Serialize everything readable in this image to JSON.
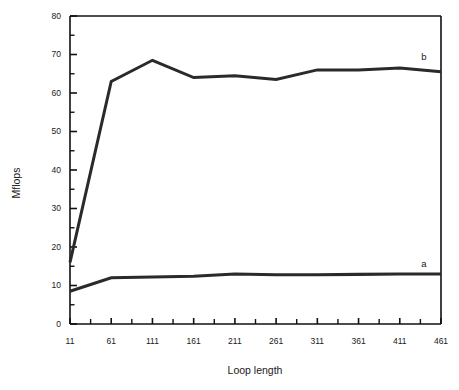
{
  "chart_data": {
    "type": "line",
    "title": "",
    "xlabel": "Loop length",
    "ylabel": "Mflops",
    "xlim": [
      11,
      461
    ],
    "ylim": [
      0,
      80
    ],
    "grid": false,
    "legend_position": "inline-right-of-curves",
    "x": [
      11,
      61,
      111,
      161,
      211,
      261,
      311,
      361,
      411,
      461
    ],
    "xticks": [
      "11",
      "61",
      "111",
      "161",
      "211",
      "261",
      "311",
      "361",
      "411",
      "461"
    ],
    "yticks": [
      "0",
      "10",
      "20",
      "30",
      "40",
      "50",
      "60",
      "70",
      "80"
    ],
    "ytick_values": [
      0,
      10,
      20,
      30,
      40,
      50,
      60,
      70,
      80
    ],
    "minor_tick_step_y": 5,
    "minor_ticks_per_x_interval": 1,
    "series": [
      {
        "name": "a",
        "label": "a",
        "color": "#2a2a2a",
        "values": [
          8.5,
          12.0,
          12.2,
          12.4,
          13.0,
          12.8,
          12.8,
          12.9,
          13.0,
          13.0
        ]
      },
      {
        "name": "b",
        "label": "b",
        "color": "#2a2a2a",
        "values": [
          16.0,
          63.0,
          68.5,
          64.0,
          64.5,
          63.5,
          66.0,
          66.0,
          66.5,
          65.5
        ]
      }
    ],
    "annotations": [
      {
        "text": "b",
        "x": 455,
        "y": 68.5
      },
      {
        "text": "a",
        "x": 440,
        "y": 16.0
      }
    ]
  }
}
